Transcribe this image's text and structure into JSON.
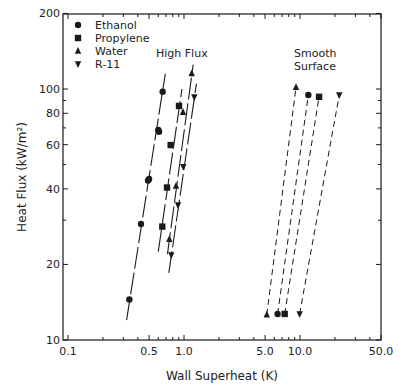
{
  "chart_data": {
    "type": "scatter",
    "title": "",
    "xlabel": "Wall Superheat (K)",
    "ylabel": "Heat Flux (kW/m²)",
    "xscale": "log",
    "yscale": "log",
    "xlim": [
      0.1,
      50.0
    ],
    "ylim": [
      10,
      200
    ],
    "x_ticks": [
      0.1,
      0.5,
      1.0,
      5.0,
      10.0,
      50.0
    ],
    "x_tick_labels": [
      "0.1",
      "0.5",
      "1.0",
      "5.0",
      "10.0",
      "50.0"
    ],
    "y_ticks": [
      10,
      20,
      40,
      60,
      80,
      100,
      200
    ],
    "y_tick_labels": [
      "10",
      "20",
      "40",
      "60",
      "80",
      "100",
      "200"
    ],
    "grid": false,
    "legend_position": "upper left",
    "annotations": [
      {
        "text": "High Flux",
        "x": 0.75,
        "y": 130
      },
      {
        "text": "Smooth",
        "x": 12.0,
        "y": 140
      },
      {
        "text": "Surface",
        "x": 12.0,
        "y": 125
      }
    ],
    "series": [
      {
        "name": "Ethanol",
        "marker": "circle",
        "group": "High Flux",
        "line": "solid",
        "x": [
          0.338,
          0.426,
          0.49,
          0.5,
          0.6,
          0.61,
          0.655
        ],
        "y": [
          14.5,
          29.0,
          43.2,
          43.8,
          68.7,
          67.5,
          97.5
        ],
        "fit": [
          [
            0.32,
            12.0
          ],
          [
            0.69,
            115
          ]
        ]
      },
      {
        "name": "Propylene",
        "marker": "square",
        "group": "High Flux",
        "line": "solid",
        "x": [
          0.65,
          0.714,
          0.768,
          0.906
        ],
        "y": [
          28.3,
          40.5,
          59.8,
          85.6
        ],
        "fit": [
          [
            0.6,
            22.5
          ],
          [
            0.96,
            100
          ]
        ]
      },
      {
        "name": "Water",
        "marker": "triangle-up",
        "group": "High Flux",
        "line": "solid",
        "x": [
          0.747,
          0.853,
          0.98,
          1.165
        ],
        "y": [
          25.2,
          41.1,
          80.9,
          115.3
        ],
        "fit": [
          [
            0.72,
            22.0
          ],
          [
            1.2,
            125
          ]
        ]
      },
      {
        "name": "R-11",
        "marker": "triangle-down",
        "group": "High Flux",
        "line": "solid",
        "x": [
          0.777,
          0.888,
          0.986,
          1.227
        ],
        "y": [
          21.8,
          34.5,
          49.0,
          92.9
        ],
        "fit": [
          [
            0.74,
            18.5
          ],
          [
            1.28,
            105
          ]
        ]
      },
      {
        "name": "Water",
        "marker": "triangle-up",
        "group": "Smooth Surface",
        "line": "dashed",
        "x": [
          5.17,
          9.24
        ],
        "y": [
          12.6,
          101.6
        ]
      },
      {
        "name": "Ethanol",
        "marker": "circle",
        "group": "Smooth Surface",
        "line": "dashed",
        "x": [
          6.41,
          11.8
        ],
        "y": [
          12.7,
          94.6
        ]
      },
      {
        "name": "Propylene",
        "marker": "square",
        "group": "Smooth Surface",
        "line": "dashed",
        "x": [
          7.38,
          14.6
        ],
        "y": [
          12.7,
          93.1
        ]
      },
      {
        "name": "R-11",
        "marker": "triangle-down",
        "group": "Smooth Surface",
        "line": "dashed",
        "x": [
          9.93,
          21.8
        ],
        "y": [
          12.7,
          94.6
        ]
      }
    ]
  },
  "legend": {
    "items": [
      {
        "label": "Ethanol",
        "marker": "circle"
      },
      {
        "label": "Propylene",
        "marker": "square"
      },
      {
        "label": "Water",
        "marker": "triangle-up"
      },
      {
        "label": "R-11",
        "marker": "triangle-down"
      }
    ]
  },
  "labels": {
    "xlabel": "Wall Superheat (K)",
    "ylabel": "Heat Flux (kW/m²)",
    "high_flux": "High Flux",
    "smooth_1": "Smooth",
    "smooth_2": "Surface"
  },
  "colors": {
    "ink": "#1a1a1a",
    "background": "#ffffff"
  }
}
